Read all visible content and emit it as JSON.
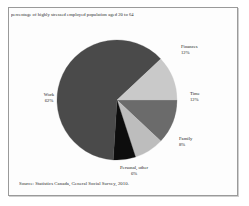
{
  "figure": {
    "title": "percentage of highly stressed employed population aged 20 to 64",
    "source": "Source: Statistics Canada, General Social Survey, 2010."
  },
  "chart_data": {
    "type": "pie",
    "title": "percentage of highly stressed employed population aged 20 to 64",
    "subtitle": "",
    "xlabel": "",
    "ylabel": "",
    "legend_position": "none",
    "grid": false,
    "labels_outside": true,
    "start_angle_deg": 0,
    "direction": "clockwise",
    "categories": [
      "Time",
      "Family",
      "Personal, other",
      "Work",
      "Finances"
    ],
    "values": [
      12,
      8,
      6,
      62,
      12
    ],
    "value_suffix": "%",
    "colors": [
      "#6b6b6b",
      "#bdbdbd",
      "#0d0d0d",
      "#4a4a4a",
      "#c9c9c9"
    ],
    "slices": [
      {
        "name": "Time",
        "value": 12,
        "display": "12%",
        "color": "#6b6b6b"
      },
      {
        "name": "Family",
        "value": 8,
        "display": "8%",
        "color": "#bdbdbd"
      },
      {
        "name": "Personal, other",
        "value": 6,
        "display": "6%",
        "color": "#0d0d0d"
      },
      {
        "name": "Work",
        "value": 62,
        "display": "62%",
        "color": "#4a4a4a"
      },
      {
        "name": "Finances",
        "value": 12,
        "display": "12%",
        "color": "#c9c9c9"
      }
    ]
  }
}
